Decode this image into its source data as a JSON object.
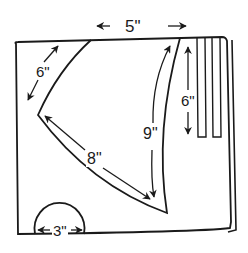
{
  "diagram": {
    "type": "sewing-pattern-cutting-layout",
    "stroke_color": "#1a1a1a",
    "background": "#ffffff",
    "pieces": [
      {
        "name": "triangle-piece",
        "shape": "curved triangle"
      },
      {
        "name": "strips",
        "shape": "three narrow vertical rectangles"
      },
      {
        "name": "semicircle-piece",
        "shape": "half circle"
      }
    ],
    "dimensions": {
      "top_width": "5\"",
      "left_edge": "6\"",
      "bottom_edge": "8\"",
      "right_edge": "9\"",
      "strip_length": "6\"",
      "semicircle_diameter": "3\""
    }
  }
}
